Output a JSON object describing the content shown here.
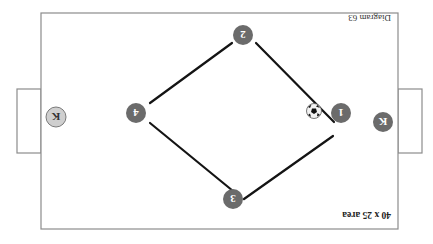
{
  "diagram": {
    "title": "Diagram 63",
    "area_label": "40 x 25 area",
    "orientation": "rotated-180",
    "colors": {
      "field_line": "#8c8c8c",
      "pass_line": "#141414",
      "player_fill": "#6b6b6b",
      "keeper_light_fill": "#cfcfcf",
      "number_text": "#ffffff"
    },
    "players": [
      {
        "id": "1",
        "label": "1"
      },
      {
        "id": "2",
        "label": "2"
      },
      {
        "id": "3",
        "label": "3"
      },
      {
        "id": "4",
        "label": "4"
      }
    ],
    "keepers": [
      {
        "id": "keeper-dark",
        "label": "K"
      },
      {
        "id": "keeper-light",
        "label": "K"
      }
    ],
    "passes": [
      {
        "from": "1",
        "to": "2"
      },
      {
        "from": "2",
        "to": "4"
      },
      {
        "from": "4",
        "to": "3"
      },
      {
        "from": "3",
        "to": "1"
      }
    ],
    "ball": {
      "icon": "soccer-ball-icon",
      "near": "1"
    }
  }
}
